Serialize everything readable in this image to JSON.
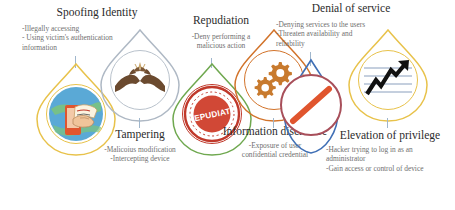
{
  "diagram": {
    "type": "pin-row",
    "count": 6
  },
  "threats": [
    {
      "id": "spoofing",
      "title": "Spoofing Identity",
      "desc_lines": [
        "-Illegally accessing",
        "- Using victim's authentication",
        "information"
      ],
      "icon": "hand-holding-id-card-icon",
      "pin_color": "#e8c24a",
      "ring_color": "#e8c24a",
      "label_position": "above"
    },
    {
      "id": "tampering",
      "title": "Tampering",
      "desc_lines": [
        "-Malicoius modification",
        "-Intercepting device"
      ],
      "icon": "gloved-hands-icon",
      "pin_color": "#aeb8c4",
      "ring_color": "#aeb8c4",
      "label_position": "below"
    },
    {
      "id": "repudiation",
      "title": "Repudiation",
      "desc_lines": [
        "-Deny performing a",
        "malicious action"
      ],
      "icon": "repudiate-stamp-icon",
      "pin_color": "#6fa84f",
      "ring_color": "#c0392b",
      "stamp_text": "REPUDIATE",
      "label_position": "above"
    },
    {
      "id": "information-disclosure",
      "title": "Information disclosure",
      "desc_lines": [
        "-Exposure of user",
        "confidential credential"
      ],
      "icon": "gears-icon",
      "pin_color": "#d2732a",
      "ring_color": "#d2732a",
      "label_position": "below"
    },
    {
      "id": "denial-of-service",
      "title": "Denial of service",
      "desc_lines": [
        "-Denying services to the users",
        "-Threaten availability and",
        "reliability"
      ],
      "icon": "prohibition-sign-icon",
      "pin_color": "#3f6fb5",
      "ring_color": "#a84f5a",
      "label_position": "above"
    },
    {
      "id": "elevation-of-privilege",
      "title": "Elevation of privilege",
      "desc_lines": [
        "-Hacker trying to log in as an",
        "administrator",
        "-Gain access or control of device"
      ],
      "icon": "rising-arrow-chart-icon",
      "pin_color": "#e8c24a",
      "ring_color": "#e8c24a",
      "label_position": "below"
    }
  ],
  "colors": {
    "connector": "#9fb6cc",
    "title_text": "#2b2b2b",
    "desc_text": "#6f6f6f",
    "background": "#ffffff"
  }
}
